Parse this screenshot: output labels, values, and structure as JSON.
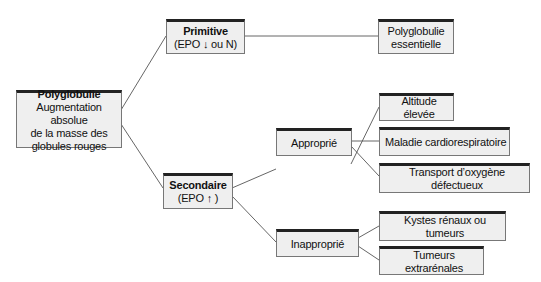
{
  "diagram": {
    "type": "tree",
    "nodes": {
      "root": {
        "title": "Polyglobulie",
        "lines": [
          "Augmentation absolue",
          "de la masse des",
          "globules rouges"
        ]
      },
      "primitive": {
        "title": "Primitive",
        "subtitle": "(EPO ↓ ou N)"
      },
      "essentielle": {
        "lines": [
          "Polyglobulie",
          "essentielle"
        ]
      },
      "secondaire": {
        "title": "Secondaire",
        "subtitle": "(EPO ↑ )"
      },
      "approprie": {
        "label": "Approprié"
      },
      "inapproprie": {
        "label": "Inapproprié"
      },
      "altitude": {
        "label": "Altitude élevée"
      },
      "cardio": {
        "label": "Maladie cardiorespiratoire"
      },
      "transport": {
        "label": "Transport d’oxygène défectueux"
      },
      "kystes": {
        "label": "Kystes rénaux ou tumeurs"
      },
      "tumeurs": {
        "label": "Tumeurs extrarénales"
      }
    },
    "edges": [
      [
        "root",
        "primitive"
      ],
      [
        "root",
        "secondaire"
      ],
      [
        "primitive",
        "essentielle"
      ],
      [
        "secondaire",
        "approprie"
      ],
      [
        "secondaire",
        "inapproprie"
      ],
      [
        "approprie",
        "altitude"
      ],
      [
        "approprie",
        "cardio"
      ],
      [
        "approprie",
        "transport"
      ],
      [
        "inapproprie",
        "kystes"
      ],
      [
        "inapproprie",
        "tumeurs"
      ]
    ],
    "colors": {
      "box_fill": "#efefef",
      "box_border": "#777777",
      "box_top_border": "#222222",
      "line": "#555555"
    }
  }
}
